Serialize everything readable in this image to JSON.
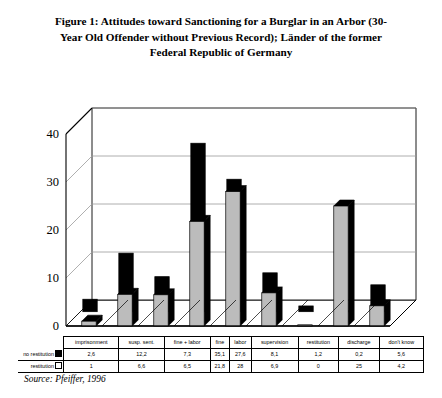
{
  "title": "Figure 1:  Attitudes toward Sanctioning for a Burglar in an Arbor (30-Year Old Offender without Previous Record); Länder of the former Federal Republic of Germany",
  "source": "Source: Pfeiffer, 1996",
  "legend": {
    "series1_label": "no restitution",
    "series2_label": "restitution"
  },
  "colors": {
    "series1": "#000000",
    "series2": "#bcbcbc",
    "axis": "#000000",
    "grid": "#9a9a9a"
  },
  "chart_data": {
    "type": "bar",
    "title": "Figure 1:  Attitudes toward Sanctioning for a Burglar in an Arbor (30-Year Old Offender without Previous Record); Länder of the former Federal Republic of Germany",
    "xlabel": "",
    "ylabel": "",
    "ylim": [
      0,
      40
    ],
    "yticks": [
      0,
      10,
      20,
      30,
      40
    ],
    "grid": true,
    "legend_position": "table-below",
    "categories": [
      "imprisonment",
      "susp. sent.",
      "fine + labor",
      "fine",
      "labor",
      "supervision",
      "restitution",
      "discharge",
      "don't know"
    ],
    "series": [
      {
        "name": "no restitution",
        "values": [
          2.6,
          12.2,
          7.3,
          35.1,
          27.6,
          8.1,
          1.2,
          0.2,
          5.6
        ],
        "display": [
          "2,6",
          "12,2",
          "7,3",
          "35,1",
          "27,6",
          "8,1",
          "1,2",
          "0,2",
          "5,6"
        ]
      },
      {
        "name": "restitution",
        "values": [
          1,
          6.6,
          6.5,
          21.8,
          28,
          6.9,
          0,
          25,
          4.2
        ],
        "display": [
          "1",
          "6,6",
          "6,5",
          "21,8",
          "28",
          "6,9",
          "0",
          "25",
          "4,2"
        ]
      }
    ]
  }
}
